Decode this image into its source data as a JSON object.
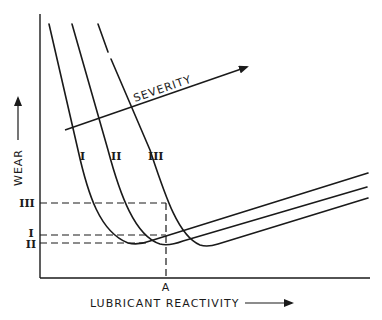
{
  "diagram": {
    "title": "",
    "x_axis_label": "LUBRICANT REACTIVITY",
    "y_axis_label": "WEAR",
    "severity_label": "SEVERITY",
    "point_a_label": "A",
    "curves": [
      {
        "id": "I",
        "label": "I"
      },
      {
        "id": "II",
        "label": "II"
      },
      {
        "id": "III",
        "label": "III"
      }
    ],
    "y_level_labels": {
      "III": "III",
      "I": "I",
      "II": "II"
    },
    "colors": {
      "ink": "#1a1a1a",
      "background": "#ffffff"
    }
  }
}
